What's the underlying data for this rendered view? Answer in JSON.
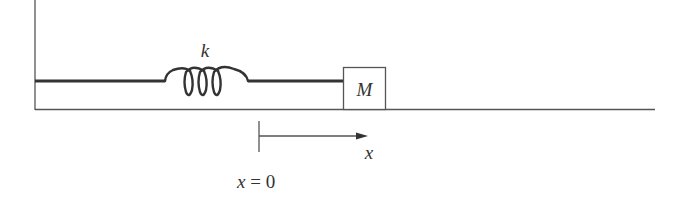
{
  "diagram": {
    "spring_label": "k",
    "mass_label": "M",
    "axis_label": "x",
    "origin_label_var": "x",
    "origin_label_eq": " = 0",
    "colors": {
      "line": "#333333",
      "thin_line": "#555555",
      "background": "#ffffff"
    }
  }
}
